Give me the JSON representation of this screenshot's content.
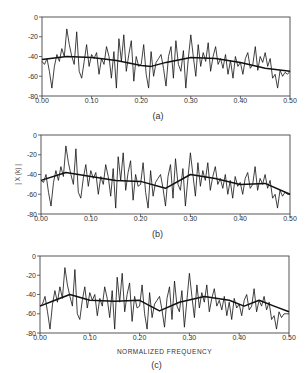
{
  "figure": {
    "xlabel_common": "NORMALIZED FREQUENCY",
    "ylabel_common": "| X (k) |"
  },
  "chart_data": [
    {
      "type": "line",
      "panel_label": "(a)",
      "xlabel": "",
      "ylabel": "",
      "xlim": [
        0.0,
        0.5
      ],
      "ylim": [
        -80,
        0
      ],
      "x_ticks": [
        "0.00",
        "0.10",
        "0.20",
        "0.30",
        "0.40",
        "0.50"
      ],
      "y_ticks": [
        "0",
        "-20",
        "-40",
        "-60",
        "-80"
      ],
      "grid": false,
      "legend": null,
      "series": [
        {
          "name": "periodogram (noisy)",
          "style": "thin",
          "x": [
            0.0,
            0.005,
            0.01,
            0.015,
            0.02,
            0.025,
            0.03,
            0.035,
            0.04,
            0.045,
            0.05,
            0.055,
            0.06,
            0.065,
            0.07,
            0.075,
            0.08,
            0.085,
            0.09,
            0.095,
            0.1,
            0.105,
            0.11,
            0.115,
            0.12,
            0.125,
            0.13,
            0.135,
            0.14,
            0.145,
            0.15,
            0.155,
            0.16,
            0.165,
            0.17,
            0.175,
            0.18,
            0.185,
            0.19,
            0.195,
            0.2,
            0.205,
            0.21,
            0.215,
            0.22,
            0.225,
            0.23,
            0.235,
            0.24,
            0.245,
            0.25,
            0.255,
            0.26,
            0.265,
            0.27,
            0.275,
            0.28,
            0.285,
            0.29,
            0.295,
            0.3,
            0.305,
            0.31,
            0.315,
            0.32,
            0.325,
            0.33,
            0.335,
            0.34,
            0.345,
            0.35,
            0.355,
            0.36,
            0.365,
            0.37,
            0.375,
            0.38,
            0.385,
            0.39,
            0.395,
            0.4,
            0.405,
            0.41,
            0.415,
            0.42,
            0.425,
            0.43,
            0.435,
            0.44,
            0.445,
            0.45,
            0.455,
            0.46,
            0.465,
            0.47,
            0.475,
            0.48,
            0.485,
            0.49,
            0.495,
            0.5
          ],
          "y": [
            -45,
            -48,
            -42,
            -55,
            -72,
            -50,
            -38,
            -45,
            -32,
            -40,
            -12,
            -28,
            -40,
            -48,
            -15,
            -55,
            -62,
            -45,
            -28,
            -50,
            -38,
            -42,
            -36,
            -58,
            -42,
            -48,
            -30,
            -40,
            -62,
            -35,
            -72,
            -22,
            -45,
            -18,
            -55,
            -38,
            -24,
            -65,
            -40,
            -50,
            -48,
            -28,
            -58,
            -72,
            -35,
            -60,
            -46,
            -42,
            -38,
            -52,
            -70,
            -40,
            -30,
            -62,
            -24,
            -48,
            -55,
            -34,
            -72,
            -42,
            -18,
            -40,
            -60,
            -28,
            -50,
            -36,
            -45,
            -26,
            -55,
            -40,
            -30,
            -48,
            -42,
            -52,
            -38,
            -58,
            -44,
            -62,
            -40,
            -50,
            -46,
            -58,
            -42,
            -36,
            -52,
            -48,
            -30,
            -54,
            -40,
            -46,
            -36,
            -50,
            -42,
            -62,
            -58,
            -72,
            -54,
            -60,
            -56,
            -58,
            -55
          ]
        },
        {
          "name": "smoothed envelope",
          "style": "thick",
          "x": [
            0.0,
            0.05,
            0.1,
            0.15,
            0.2,
            0.22,
            0.25,
            0.3,
            0.35,
            0.4,
            0.45,
            0.5
          ],
          "y": [
            -43,
            -40,
            -41,
            -44,
            -49,
            -50,
            -46,
            -41,
            -42,
            -46,
            -52,
            -55
          ]
        }
      ]
    },
    {
      "type": "line",
      "panel_label": "(b)",
      "xlabel": "",
      "ylabel": "| X (k) |",
      "xlim": [
        0.0,
        0.5
      ],
      "ylim": [
        -80,
        0
      ],
      "x_ticks": [
        "0.00",
        "0.10",
        "0.20",
        "0.30",
        "0.40",
        "0.50"
      ],
      "y_ticks": [
        "0",
        "-20",
        "-40",
        "-60",
        "-80"
      ],
      "grid": false,
      "legend": null,
      "series": [
        {
          "name": "periodogram (noisy)",
          "style": "thin",
          "x": [
            0.0,
            0.005,
            0.01,
            0.015,
            0.02,
            0.025,
            0.03,
            0.035,
            0.04,
            0.045,
            0.05,
            0.055,
            0.06,
            0.065,
            0.07,
            0.075,
            0.08,
            0.085,
            0.09,
            0.095,
            0.1,
            0.105,
            0.11,
            0.115,
            0.12,
            0.125,
            0.13,
            0.135,
            0.14,
            0.145,
            0.15,
            0.155,
            0.16,
            0.165,
            0.17,
            0.175,
            0.18,
            0.185,
            0.19,
            0.195,
            0.2,
            0.205,
            0.21,
            0.215,
            0.22,
            0.225,
            0.23,
            0.235,
            0.24,
            0.245,
            0.25,
            0.255,
            0.26,
            0.265,
            0.27,
            0.275,
            0.28,
            0.285,
            0.29,
            0.295,
            0.3,
            0.305,
            0.31,
            0.315,
            0.32,
            0.325,
            0.33,
            0.335,
            0.34,
            0.345,
            0.35,
            0.355,
            0.36,
            0.365,
            0.37,
            0.375,
            0.38,
            0.385,
            0.39,
            0.395,
            0.4,
            0.405,
            0.41,
            0.415,
            0.42,
            0.425,
            0.43,
            0.435,
            0.44,
            0.445,
            0.45,
            0.455,
            0.46,
            0.465,
            0.47,
            0.475,
            0.48,
            0.485,
            0.49,
            0.495,
            0.5
          ],
          "y": [
            -46,
            -48,
            -40,
            -58,
            -72,
            -48,
            -36,
            -46,
            -32,
            -42,
            -11,
            -28,
            -40,
            -50,
            -14,
            -58,
            -64,
            -44,
            -30,
            -52,
            -36,
            -44,
            -38,
            -60,
            -42,
            -50,
            -30,
            -42,
            -62,
            -34,
            -74,
            -22,
            -46,
            -18,
            -56,
            -38,
            -26,
            -66,
            -40,
            -52,
            -50,
            -28,
            -58,
            -74,
            -36,
            -62,
            -48,
            -44,
            -40,
            -54,
            -72,
            -42,
            -30,
            -64,
            -24,
            -50,
            -56,
            -34,
            -72,
            -44,
            -18,
            -40,
            -62,
            -28,
            -52,
            -36,
            -46,
            -28,
            -56,
            -42,
            -32,
            -50,
            -44,
            -54,
            -40,
            -60,
            -46,
            -64,
            -42,
            -52,
            -48,
            -60,
            -44,
            -38,
            -54,
            -50,
            -32,
            -56,
            -44,
            -50,
            -40,
            -54,
            -46,
            -64,
            -60,
            -74,
            -56,
            -62,
            -58,
            -60,
            -60
          ]
        },
        {
          "name": "smoothed envelope",
          "style": "thick",
          "x": [
            0.0,
            0.05,
            0.1,
            0.15,
            0.2,
            0.25,
            0.3,
            0.35,
            0.4,
            0.45,
            0.5
          ],
          "y": [
            -46,
            -38,
            -42,
            -46,
            -47,
            -54,
            -40,
            -44,
            -50,
            -49,
            -60
          ]
        }
      ]
    },
    {
      "type": "line",
      "panel_label": "(c)",
      "xlabel": "NORMALIZED FREQUENCY",
      "ylabel": "",
      "xlim": [
        0.0,
        0.5
      ],
      "ylim": [
        -80,
        0
      ],
      "x_ticks": [
        "0.00",
        "0.10",
        "0.20",
        "0.30",
        "0.40",
        "0.50"
      ],
      "y_ticks": [
        "0",
        "-20",
        "-40",
        "-60",
        "-80"
      ],
      "grid": false,
      "legend": null,
      "series": [
        {
          "name": "periodogram (noisy)",
          "style": "thin",
          "x": [
            0.0,
            0.005,
            0.01,
            0.015,
            0.02,
            0.025,
            0.03,
            0.035,
            0.04,
            0.045,
            0.05,
            0.055,
            0.06,
            0.065,
            0.07,
            0.075,
            0.08,
            0.085,
            0.09,
            0.095,
            0.1,
            0.105,
            0.11,
            0.115,
            0.12,
            0.125,
            0.13,
            0.135,
            0.14,
            0.145,
            0.15,
            0.155,
            0.16,
            0.165,
            0.17,
            0.175,
            0.18,
            0.185,
            0.19,
            0.195,
            0.2,
            0.205,
            0.21,
            0.215,
            0.22,
            0.225,
            0.23,
            0.235,
            0.24,
            0.245,
            0.25,
            0.255,
            0.26,
            0.265,
            0.27,
            0.275,
            0.28,
            0.285,
            0.29,
            0.295,
            0.3,
            0.305,
            0.31,
            0.315,
            0.32,
            0.325,
            0.33,
            0.335,
            0.34,
            0.345,
            0.35,
            0.355,
            0.36,
            0.365,
            0.37,
            0.375,
            0.38,
            0.385,
            0.39,
            0.395,
            0.4,
            0.405,
            0.41,
            0.415,
            0.42,
            0.425,
            0.43,
            0.435,
            0.44,
            0.445,
            0.45,
            0.455,
            0.46,
            0.465,
            0.47,
            0.475,
            0.48,
            0.485,
            0.49,
            0.495,
            0.5
          ],
          "y": [
            -52,
            -50,
            -42,
            -58,
            -76,
            -50,
            -36,
            -48,
            -32,
            -44,
            -12,
            -30,
            -42,
            -52,
            -14,
            -60,
            -66,
            -46,
            -32,
            -54,
            -38,
            -46,
            -40,
            -62,
            -44,
            -52,
            -32,
            -44,
            -64,
            -36,
            -76,
            -22,
            -48,
            -18,
            -58,
            -40,
            -28,
            -68,
            -42,
            -54,
            -52,
            -30,
            -60,
            -76,
            -38,
            -64,
            -50,
            -46,
            -42,
            -56,
            -74,
            -44,
            -32,
            -66,
            -26,
            -52,
            -58,
            -36,
            -74,
            -46,
            -18,
            -42,
            -64,
            -30,
            -54,
            -38,
            -48,
            -30,
            -58,
            -44,
            -34,
            -52,
            -46,
            -56,
            -42,
            -62,
            -48,
            -66,
            -44,
            -54,
            -50,
            -62,
            -46,
            -40,
            -56,
            -52,
            -34,
            -58,
            -46,
            -52,
            -42,
            -56,
            -48,
            -66,
            -62,
            -76,
            -58,
            -64,
            -60,
            -60,
            -60
          ]
        },
        {
          "name": "smoothed envelope",
          "style": "thick",
          "x": [
            0.0,
            0.03,
            0.06,
            0.1,
            0.15,
            0.2,
            0.24,
            0.28,
            0.33,
            0.38,
            0.41,
            0.44,
            0.47,
            0.5
          ],
          "y": [
            -52,
            -46,
            -40,
            -46,
            -47,
            -46,
            -57,
            -48,
            -42,
            -46,
            -52,
            -46,
            -52,
            -58
          ]
        }
      ]
    }
  ]
}
